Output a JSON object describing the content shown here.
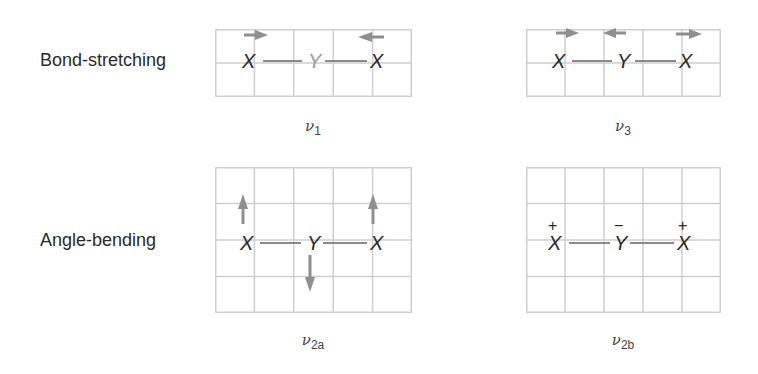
{
  "rows": [
    {
      "label": "Bond-stretching"
    },
    {
      "label": "Angle-bending"
    }
  ],
  "colors": {
    "grid": "#cfcfcf",
    "bond": "#8a8a8a",
    "arrow": "#8f8f8f",
    "atom_text": "#2a2a2a",
    "faded_atom": "#9a9a9a"
  },
  "panels": [
    {
      "id": "nu1",
      "caption_symbol": "ν",
      "caption_sub": "1",
      "atoms": [
        "X",
        "Y",
        "X"
      ],
      "center_atom_faded": true,
      "arrows": [
        {
          "atom": 0,
          "direction": "right"
        },
        {
          "atom": 2,
          "direction": "left"
        }
      ],
      "signs": []
    },
    {
      "id": "nu3",
      "caption_symbol": "ν",
      "caption_sub": "3",
      "atoms": [
        "X",
        "Y",
        "X"
      ],
      "center_atom_faded": false,
      "arrows": [
        {
          "atom": 0,
          "direction": "right"
        },
        {
          "atom": 1,
          "direction": "left"
        },
        {
          "atom": 2,
          "direction": "right"
        }
      ],
      "signs": []
    },
    {
      "id": "nu2a",
      "caption_symbol": "ν",
      "caption_sub": "2a",
      "atoms": [
        "X",
        "Y",
        "X"
      ],
      "center_atom_faded": false,
      "arrows": [
        {
          "atom": 0,
          "direction": "up"
        },
        {
          "atom": 1,
          "direction": "down"
        },
        {
          "atom": 2,
          "direction": "up"
        }
      ],
      "signs": []
    },
    {
      "id": "nu2b",
      "caption_symbol": "ν",
      "caption_sub": "2b",
      "atoms": [
        "X",
        "Y",
        "X"
      ],
      "center_atom_faded": false,
      "arrows": [],
      "signs": [
        "+",
        "−",
        "+"
      ]
    }
  ]
}
